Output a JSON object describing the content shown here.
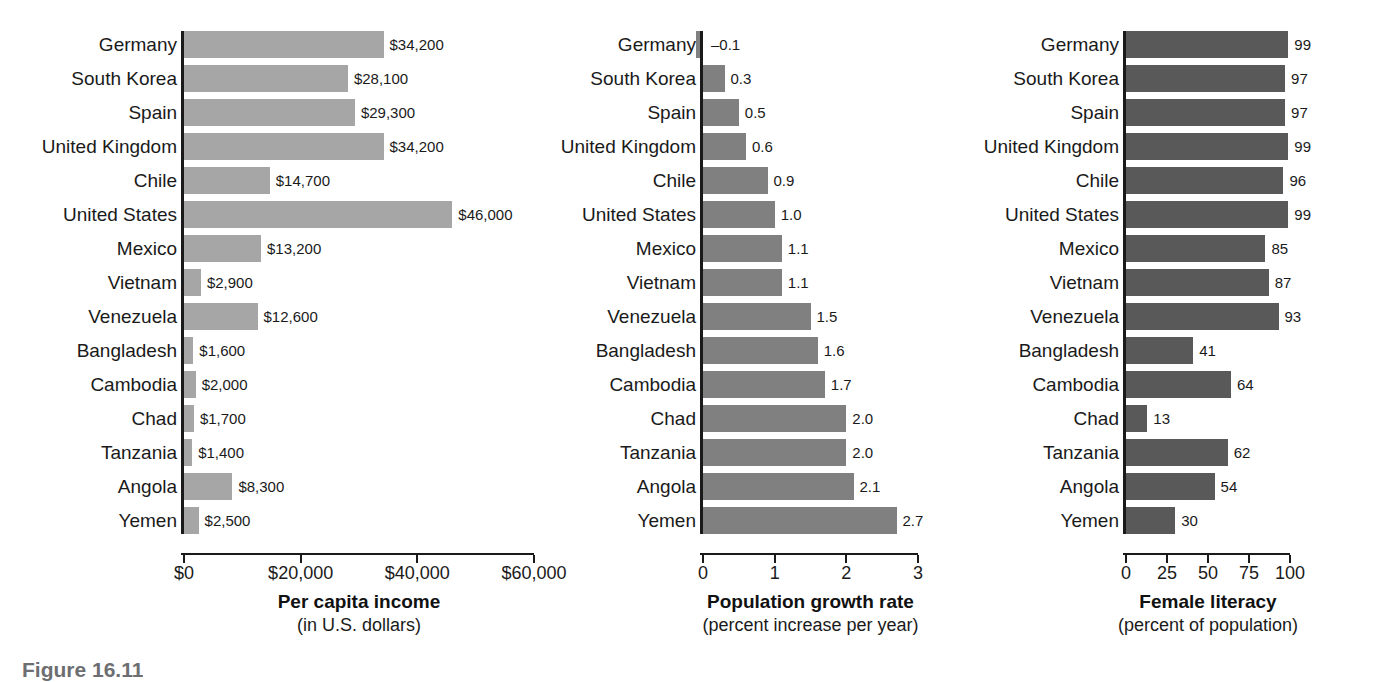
{
  "figure": {
    "caption": "Figure 16.11"
  },
  "chart_data": [
    {
      "type": "bar",
      "orientation": "horizontal",
      "title": "Per capita income",
      "subtitle": "(in U.S. dollars)",
      "xlabel": "Per capita income (in U.S. dollars)",
      "ylabel": "",
      "grid": false,
      "legend": "none",
      "bar_color": "#a6a6a6",
      "xlim": [
        0,
        60000
      ],
      "ticks": [
        0,
        20000,
        40000,
        60000
      ],
      "tick_labels": [
        "$0",
        "$20,000",
        "$40,000",
        "$60,000"
      ],
      "categories": [
        "Germany",
        "South Korea",
        "Spain",
        "United Kingdom",
        "Chile",
        "United States",
        "Mexico",
        "Vietnam",
        "Venezuela",
        "Bangladesh",
        "Cambodia",
        "Chad",
        "Tanzania",
        "Angola",
        "Yemen"
      ],
      "values": [
        34200,
        28100,
        29300,
        34200,
        14700,
        46000,
        13200,
        2900,
        12600,
        1600,
        2000,
        1700,
        1400,
        8300,
        2500
      ],
      "value_labels": [
        "$34,200",
        "$28,100",
        "$29,300",
        "$34,200",
        "$14,700",
        "$46,000",
        "$13,200",
        "$2,900",
        "$12,600",
        "$1,600",
        "$2,000",
        "$1,700",
        "$1,400",
        "$8,300",
        "$2,500"
      ]
    },
    {
      "type": "bar",
      "orientation": "horizontal",
      "title": "Population growth rate",
      "subtitle": "(percent increase per year)",
      "xlabel": "Population growth rate (percent increase per year)",
      "ylabel": "",
      "grid": false,
      "legend": "none",
      "bar_color": "#808080",
      "xlim": [
        0,
        3
      ],
      "ticks": [
        0,
        1,
        2,
        3
      ],
      "tick_labels": [
        "0",
        "1",
        "2",
        "3"
      ],
      "categories": [
        "Germany",
        "South Korea",
        "Spain",
        "United Kingdom",
        "Chile",
        "United States",
        "Mexico",
        "Vietnam",
        "Venezuela",
        "Bangladesh",
        "Cambodia",
        "Chad",
        "Tanzania",
        "Angola",
        "Yemen"
      ],
      "values": [
        -0.1,
        0.3,
        0.5,
        0.6,
        0.9,
        1.0,
        1.1,
        1.1,
        1.5,
        1.6,
        1.7,
        2.0,
        2.0,
        2.1,
        2.7
      ],
      "value_labels": [
        "–0.1",
        "0.3",
        "0.5",
        "0.6",
        "0.9",
        "1.0",
        "1.1",
        "1.1",
        "1.5",
        "1.6",
        "1.7",
        "2.0",
        "2.0",
        "2.1",
        "2.7"
      ]
    },
    {
      "type": "bar",
      "orientation": "horizontal",
      "title": "Female literacy",
      "subtitle": "(percent of population)",
      "xlabel": "Female literacy (percent of population)",
      "ylabel": "",
      "grid": false,
      "legend": "none",
      "bar_color": "#595959",
      "xlim": [
        0,
        100
      ],
      "ticks": [
        0,
        25,
        50,
        75,
        100
      ],
      "tick_labels": [
        "0",
        "25",
        "50",
        "75",
        "100"
      ],
      "categories": [
        "Germany",
        "South Korea",
        "Spain",
        "United Kingdom",
        "Chile",
        "United States",
        "Mexico",
        "Vietnam",
        "Venezuela",
        "Bangladesh",
        "Cambodia",
        "Chad",
        "Tanzania",
        "Angola",
        "Yemen"
      ],
      "values": [
        99,
        97,
        97,
        99,
        96,
        99,
        85,
        87,
        93,
        41,
        64,
        13,
        62,
        54,
        30
      ],
      "value_labels": [
        "99",
        "97",
        "97",
        "99",
        "96",
        "99",
        "85",
        "87",
        "93",
        "41",
        "64",
        "13",
        "62",
        "54",
        "30"
      ]
    }
  ]
}
